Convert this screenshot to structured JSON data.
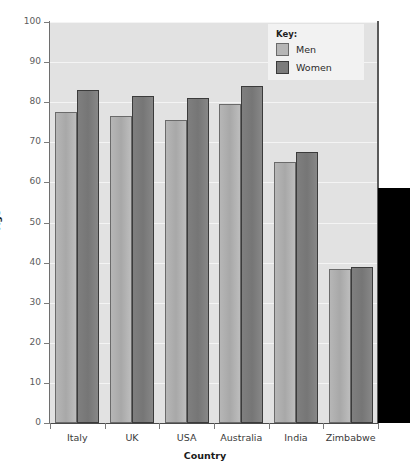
{
  "chart_data": {
    "type": "bar",
    "title": "",
    "subtitle": "",
    "xlabel": "Country",
    "ylabel": "Age",
    "categories": [
      "Italy",
      "UK",
      "USA",
      "Australia",
      "India",
      "Zimbabwe"
    ],
    "series": [
      {
        "name": "Men",
        "color": "#b6b6b6",
        "values": [
          77.5,
          76.5,
          75.5,
          79.5,
          65.0,
          38.5
        ]
      },
      {
        "name": "Women",
        "color": "#7c7c7c",
        "values": [
          83.0,
          81.5,
          81.0,
          84.0,
          67.5,
          39.0
        ]
      }
    ],
    "ylim": [
      0,
      100
    ],
    "ytick_step": 10,
    "yticks": [
      "0",
      "10",
      "20",
      "30",
      "40",
      "50",
      "60",
      "70",
      "80",
      "90",
      "100"
    ],
    "grid": true,
    "grid_axis": "y",
    "legend_position": "top-right",
    "legend_title": "Key:",
    "plot_background": "#e2e2e2",
    "gridline_color": "#f4f4f4"
  },
  "legend": {
    "title": "Key:",
    "entries": [
      {
        "label": "Men",
        "swatch": "men"
      },
      {
        "label": "Women",
        "swatch": "women"
      }
    ]
  },
  "axes": {
    "x_title": "Country",
    "y_title": "Age"
  },
  "overlay": {
    "color": "#000000"
  }
}
